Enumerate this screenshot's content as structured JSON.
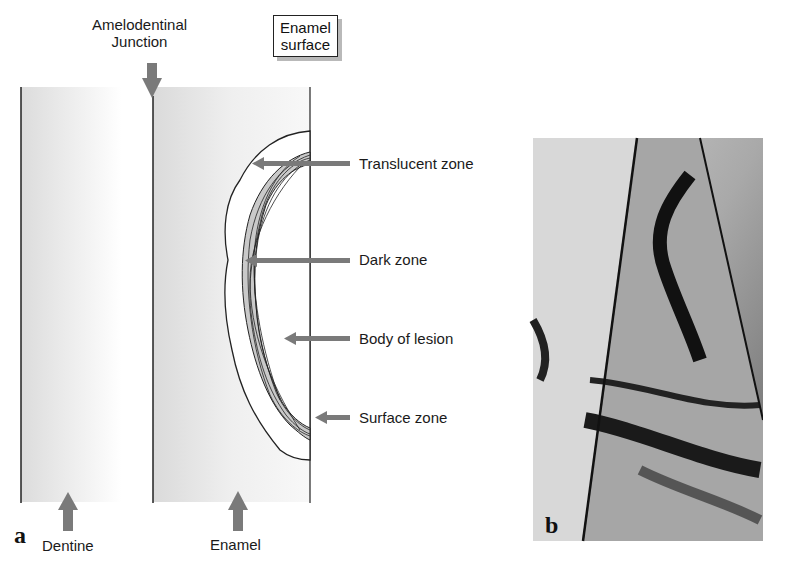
{
  "figure": {
    "panel_a": {
      "letter": "a",
      "labels": {
        "adj_line1": "Amelodentinal",
        "adj_line2": "Junction",
        "enamel_surface_line1": "Enamel",
        "enamel_surface_line2": "surface",
        "translucent_zone": "Translucent zone",
        "dark_zone": "Dark zone",
        "body_of_lesion": "Body of lesion",
        "surface_zone": "Surface zone",
        "dentine": "Dentine",
        "enamel": "Enamel"
      },
      "colors": {
        "arrow": "#7a7a7a",
        "tissue_shade": "#e6e6e6",
        "line": "#222222"
      }
    },
    "panel_b": {
      "letter": "b",
      "description": "micrograph of enamel lesion section"
    }
  }
}
